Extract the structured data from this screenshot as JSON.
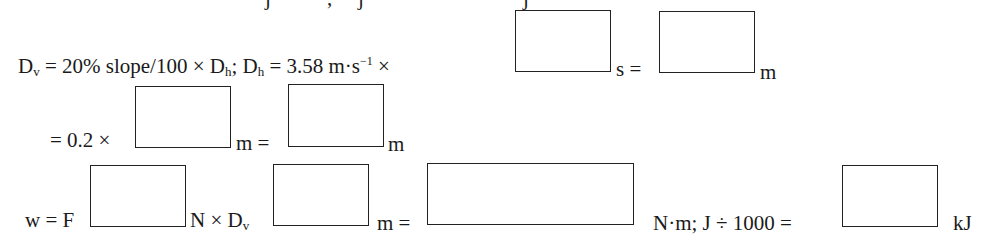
{
  "document": {
    "top_cutoff_text": "j      ,   j                      j",
    "line1": {
      "dv_label": "D",
      "dv_sub": "v",
      "eq_part": " = 20% slope/100 × D",
      "dh_sub": "h",
      "semi": "; D",
      "dh_sub2": "h",
      "speed": " = 3.58 m·s",
      "exp": "−1",
      "times": " ×",
      "unit_s": "s =",
      "unit_m": "m"
    },
    "line2": {
      "prefix": "= 0.2 ×",
      "unit_m_eq": "m =",
      "unit_m": "m"
    },
    "line3": {
      "w_eq_f": "w = F",
      "n_times_d": "N × D",
      "dv_sub": "v",
      "m_eq": "m =",
      "nm_tail": "N·m; J ÷ 1000 =",
      "unit_kj": "kJ"
    },
    "answer_boxes": [
      {
        "id": "time_s",
        "value": ""
      },
      {
        "id": "dh_m",
        "value": ""
      },
      {
        "id": "dh_input_m",
        "value": ""
      },
      {
        "id": "dv_m",
        "value": ""
      },
      {
        "id": "force_n",
        "value": ""
      },
      {
        "id": "dv_work_m",
        "value": ""
      },
      {
        "id": "work_nm",
        "value": ""
      },
      {
        "id": "work_kj",
        "value": ""
      }
    ]
  }
}
